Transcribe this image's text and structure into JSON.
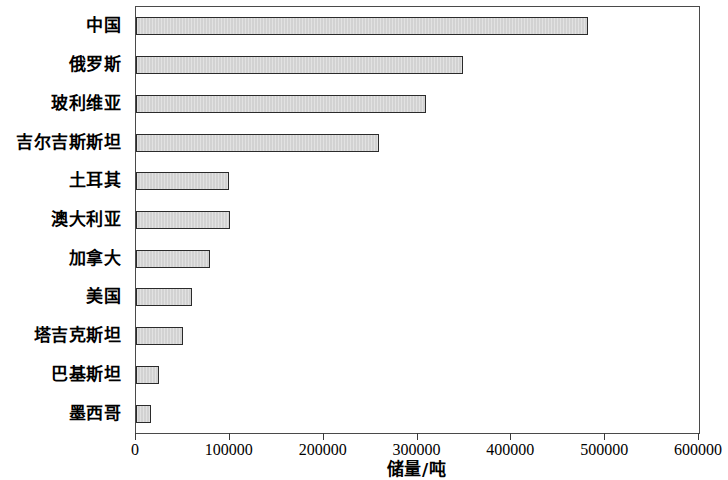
{
  "chart_data": {
    "type": "bar",
    "orientation": "horizontal",
    "title": "",
    "xlabel": "储量/吨",
    "ylabel": "",
    "xlim": [
      0,
      600000
    ],
    "xticks": [
      0,
      100000,
      200000,
      300000,
      400000,
      500000,
      600000
    ],
    "xtick_labels": [
      "0",
      "100000",
      "200000",
      "300000",
      "400000",
      "500000",
      "600000"
    ],
    "grid": false,
    "legend": null,
    "categories": [
      "中国",
      "俄罗斯",
      "玻利维亚",
      "吉尔吉斯斯坦",
      "土耳其",
      "澳大利亚",
      "加拿大",
      "美国",
      "塔吉克斯坦",
      "巴基斯坦",
      "墨西哥"
    ],
    "values": [
      482000,
      349000,
      309000,
      259000,
      99000,
      100000,
      79000,
      60000,
      50000,
      24000,
      16000
    ],
    "bar_fill_color": "#d2d2d2",
    "bar_edge_color": "#2b2b2b",
    "frame_color": "#4a4a4a",
    "background_color": "#ffffff"
  }
}
